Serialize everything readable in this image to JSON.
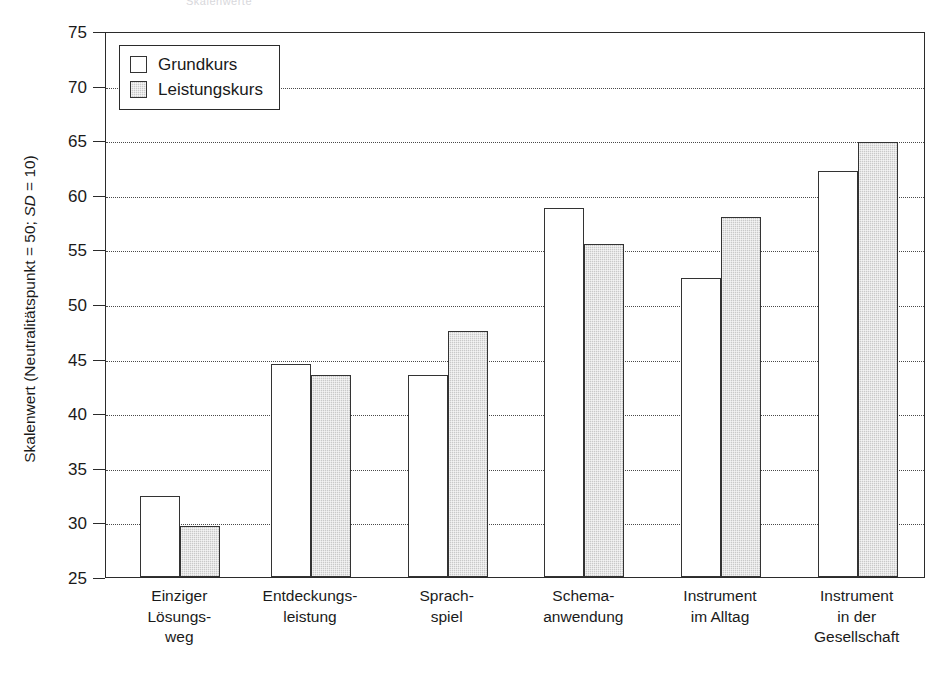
{
  "ghost_title": "Skalenwerte",
  "axis": {
    "y_title_pre": "Skalenwert (Neutralitätspunkt = 50; ",
    "y_title_italic": "SD",
    "y_title_post": " = 10)"
  },
  "legend": {
    "items": [
      {
        "label": "Grundkurs",
        "style": "light"
      },
      {
        "label": "Leistungskurs",
        "style": "dark"
      }
    ]
  },
  "chart_data": {
    "type": "bar",
    "title": "",
    "xlabel": "",
    "ylabel": "Skalenwert (Neutralitätspunkt = 50; SD = 10)",
    "ylim": [
      25,
      75
    ],
    "yticks": [
      75,
      70,
      65,
      60,
      55,
      50,
      45,
      40,
      35,
      30,
      25
    ],
    "grid": true,
    "legend_position": "top-left",
    "categories": [
      "Einziger\nLösungs-\nweg",
      "Entdeckungs-\nleistung",
      "Sprach-\nspiel",
      "Schema-\nanwendung",
      "Instrument\nim Alltag",
      "Instrument\nin der\nGesellschaft"
    ],
    "category_labels_flat": [
      "Einziger Lösungsweg",
      "Entdeckungsleistung",
      "Sprachspiel",
      "Schemaanwendung",
      "Instrument im Alltag",
      "Instrument in der Gesellschaft"
    ],
    "series": [
      {
        "name": "Grundkurs",
        "values": [
          32.4,
          44.5,
          43.5,
          58.8,
          52.4,
          62.2
        ]
      },
      {
        "name": "Leistungskurs",
        "values": [
          29.7,
          43.5,
          47.5,
          55.5,
          58.0,
          64.8
        ]
      }
    ]
  },
  "ytick_labels": [
    "75",
    "70",
    "65",
    "60",
    "55",
    "50",
    "45",
    "40",
    "35",
    "30",
    "25"
  ]
}
